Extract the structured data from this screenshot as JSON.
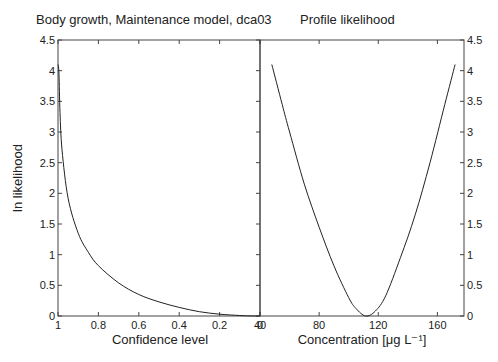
{
  "chart_data": [
    {
      "type": "line",
      "title": "Body growth, Maintenance model, dca03",
      "xlabel": "Confidence level",
      "ylabel": "ln likelihood",
      "xlim": [
        1,
        0
      ],
      "ylim": [
        0,
        4.5
      ],
      "x_ticks": [
        1,
        0.8,
        0.6,
        0.4,
        0.2,
        0
      ],
      "x_tick_labels": [
        "1",
        "0.8",
        "0.6",
        "0.4",
        "0.2",
        "0"
      ],
      "y_ticks": [
        0,
        0.5,
        1,
        1.5,
        2,
        2.5,
        3,
        3.5,
        4,
        4.5
      ],
      "y_tick_labels": [
        "0",
        "0.5",
        "1",
        "1.5",
        "2",
        "2.5",
        "3",
        "3.5",
        "4",
        "4.5"
      ],
      "grid": false,
      "series": [
        {
          "name": "ln likelihood vs confidence",
          "x": [
            0.999,
            0.995,
            0.99,
            0.98,
            0.95,
            0.9,
            0.85,
            0.8,
            0.7,
            0.6,
            0.5,
            0.4,
            0.3,
            0.2,
            0.1,
            0.05,
            0.0
          ],
          "y": [
            4.1,
            3.94,
            3.32,
            2.71,
            1.92,
            1.35,
            1.04,
            0.82,
            0.54,
            0.35,
            0.23,
            0.14,
            0.07,
            0.03,
            0.008,
            0.002,
            0.0
          ]
        }
      ]
    },
    {
      "type": "line",
      "title": "Profile likelihood",
      "xlabel": "Concentration [μg L⁻¹]",
      "ylabel": "",
      "xlim": [
        40,
        178
      ],
      "ylim": [
        0,
        4.5
      ],
      "x_ticks": [
        40,
        80,
        120,
        160
      ],
      "x_tick_labels": [
        "40",
        "80",
        "120",
        "160"
      ],
      "y_ticks": [
        0,
        0.5,
        1,
        1.5,
        2,
        2.5,
        3,
        3.5,
        4,
        4.5
      ],
      "y_tick_labels": [
        "0",
        "0.5",
        "1",
        "1.5",
        "2",
        "2.5",
        "3",
        "3.5",
        "4",
        "4.5"
      ],
      "y_axis_side": "right",
      "grid": false,
      "series": [
        {
          "name": "profile ln likelihood",
          "x": [
            48,
            55,
            60,
            70,
            80,
            90,
            100,
            105,
            111.5,
            118,
            125,
            135,
            145,
            155,
            165,
            172
          ],
          "y": [
            4.1,
            3.45,
            3.0,
            2.15,
            1.45,
            0.82,
            0.3,
            0.12,
            0.0,
            0.08,
            0.33,
            0.95,
            1.65,
            2.5,
            3.45,
            4.1
          ]
        }
      ]
    }
  ]
}
